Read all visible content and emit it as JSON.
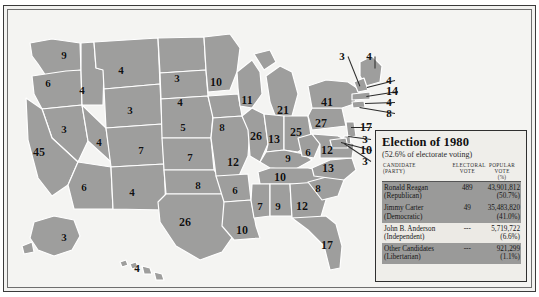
{
  "title": "Election of 1980",
  "subtitle": "(52.6% of electorate voting)",
  "columns": {
    "candidate": "CANDIDATE",
    "candidate2": "(PARTY)",
    "electoral": "ELECTORAL",
    "electoral2": "VOTE",
    "popular": "POPULAR VOTE",
    "popular2": "(%)"
  },
  "rows": [
    {
      "candidate": "Ronald Reagan",
      "party": "(Republican)",
      "electoral": "489",
      "popular": "43,901,812",
      "percent": "(50.7%)",
      "shaded": true
    },
    {
      "candidate": "Jimmy Carter",
      "party": "(Democratic)",
      "electoral": "49",
      "popular": "35,483,820",
      "percent": "(41.0%)",
      "shaded": true
    },
    {
      "candidate": "John B. Anderson",
      "party": "(Independent)",
      "electoral": "---",
      "popular": "5,719,722",
      "percent": "(6.6%)",
      "shaded": false
    },
    {
      "candidate": "Other Candidates",
      "party": "(Libertarian)",
      "electoral": "---",
      "popular": "921,299",
      "percent": "(1.1%)",
      "shaded": true
    }
  ],
  "colors": {
    "state_fill": "#9e9e9d",
    "state_border": "#ffffff",
    "page_background": "#f2f2f0",
    "legend_background": "#efeeea",
    "legend_shade": "#9a9a99",
    "text": "#111111"
  },
  "map": {
    "states": [
      {
        "name": "Washington",
        "ev": "9",
        "x": 56,
        "y": 45
      },
      {
        "name": "Oregon",
        "ev": "6",
        "x": 40,
        "y": 73
      },
      {
        "name": "Idaho",
        "ev": "4",
        "x": 74,
        "y": 80
      },
      {
        "name": "Montana",
        "ev": "4",
        "x": 113,
        "y": 60
      },
      {
        "name": "Wyoming",
        "ev": "3",
        "x": 122,
        "y": 100
      },
      {
        "name": "Nevada",
        "ev": "3",
        "x": 56,
        "y": 119
      },
      {
        "name": "Utah",
        "ev": "4",
        "x": 91,
        "y": 132
      },
      {
        "name": "California",
        "ev": "45",
        "x": 31,
        "y": 142
      },
      {
        "name": "Colorado",
        "ev": "7",
        "x": 133,
        "y": 140
      },
      {
        "name": "Arizona",
        "ev": "6",
        "x": 76,
        "y": 177
      },
      {
        "name": "New Mexico",
        "ev": "4",
        "x": 124,
        "y": 182
      },
      {
        "name": "North Dakota",
        "ev": "3",
        "x": 169,
        "y": 68
      },
      {
        "name": "South Dakota",
        "ev": "4",
        "x": 172,
        "y": 92
      },
      {
        "name": "Nebraska",
        "ev": "5",
        "x": 175,
        "y": 117
      },
      {
        "name": "Kansas",
        "ev": "7",
        "x": 182,
        "y": 147
      },
      {
        "name": "Oklahoma",
        "ev": "8",
        "x": 190,
        "y": 175
      },
      {
        "name": "Texas",
        "ev": "26",
        "x": 177,
        "y": 212
      },
      {
        "name": "Minnesota",
        "ev": "10",
        "x": 208,
        "y": 72
      },
      {
        "name": "Iowa",
        "ev": "8",
        "x": 214,
        "y": 117
      },
      {
        "name": "Missouri",
        "ev": "12",
        "x": 225,
        "y": 152
      },
      {
        "name": "Arkansas",
        "ev": "6",
        "x": 227,
        "y": 180
      },
      {
        "name": "Louisiana",
        "ev": "10",
        "x": 234,
        "y": 220
      },
      {
        "name": "Wisconsin",
        "ev": "11",
        "x": 239,
        "y": 90
      },
      {
        "name": "Illinois",
        "ev": "26",
        "x": 248,
        "y": 126
      },
      {
        "name": "Michigan",
        "ev": "21",
        "x": 275,
        "y": 100
      },
      {
        "name": "Indiana",
        "ev": "13",
        "x": 266,
        "y": 129
      },
      {
        "name": "Ohio",
        "ev": "25",
        "x": 288,
        "y": 122
      },
      {
        "name": "Kentucky",
        "ev": "9",
        "x": 280,
        "y": 148
      },
      {
        "name": "Tennessee",
        "ev": "10",
        "x": 272,
        "y": 167
      },
      {
        "name": "Mississippi",
        "ev": "7",
        "x": 252,
        "y": 196
      },
      {
        "name": "Alabama",
        "ev": "9",
        "x": 270,
        "y": 196
      },
      {
        "name": "Georgia",
        "ev": "12",
        "x": 294,
        "y": 196
      },
      {
        "name": "Florida",
        "ev": "17",
        "x": 319,
        "y": 235
      },
      {
        "name": "South Carolina",
        "ev": "8",
        "x": 310,
        "y": 178
      },
      {
        "name": "North Carolina",
        "ev": "13",
        "x": 320,
        "y": 158
      },
      {
        "name": "West Virginia",
        "ev": "6",
        "x": 300,
        "y": 142
      },
      {
        "name": "Virginia",
        "ev": "12",
        "x": 319,
        "y": 140
      },
      {
        "name": "New York",
        "ev": "41",
        "x": 319,
        "y": 92
      },
      {
        "name": "Pennsylvania",
        "ev": "27",
        "x": 313,
        "y": 113
      },
      {
        "name": "Alaska",
        "ev": "3",
        "x": 56,
        "y": 227
      },
      {
        "name": "Hawaii",
        "ev": "4",
        "x": 129,
        "y": 258
      }
    ],
    "callouts": [
      {
        "name": "Vermont",
        "ev": "3",
        "lx": 340,
        "ly": 46,
        "px": 352,
        "py": 76
      },
      {
        "name": "Maine",
        "ev": "4",
        "lx": 367,
        "ly": 46,
        "px": 367,
        "py": 58
      },
      {
        "name": "New Hampshire",
        "ev": "4",
        "lx": 387,
        "ly": 70,
        "px": 359,
        "py": 77
      },
      {
        "name": "Massachusetts",
        "ev": "14",
        "lx": 390,
        "ly": 81,
        "px": 358,
        "py": 86
      },
      {
        "name": "Rhode Island",
        "ev": "4",
        "lx": 387,
        "ly": 92,
        "px": 357,
        "py": 93
      },
      {
        "name": "Connecticut",
        "ev": "8",
        "lx": 387,
        "ly": 103,
        "px": 352,
        "py": 97
      },
      {
        "name": "New Jersey",
        "ev": "17",
        "lx": 364,
        "ly": 117,
        "px": 343,
        "py": 117
      },
      {
        "name": "Delaware",
        "ev": "3",
        "lx": 363,
        "ly": 129,
        "px": 340,
        "py": 126
      },
      {
        "name": "Maryland",
        "ev": "10",
        "lx": 364,
        "ly": 140,
        "px": 333,
        "py": 132
      },
      {
        "name": "District of Columbia",
        "ev": "3",
        "lx": 363,
        "ly": 151,
        "px": 336,
        "py": 133
      }
    ]
  }
}
